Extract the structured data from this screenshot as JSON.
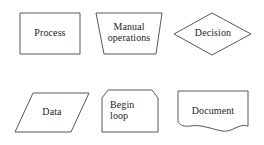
{
  "diagram": {
    "background_color": "#ffffff",
    "stroke_color": "#58585a",
    "text_color": "#1d1d1f",
    "width": 264,
    "height": 145,
    "shapes": [
      {
        "id": "process",
        "label": "Process",
        "symbol_type": "rectangle",
        "points": "20,13 80,13 80,54 20,54"
      },
      {
        "id": "manual-operations",
        "label": "Manual\noperations",
        "symbol_type": "trapezoid",
        "points": "96,13 162,13 156,54 104,54"
      },
      {
        "id": "decision",
        "label": "Decision",
        "symbol_type": "diamond",
        "points": "174,34 212,13 251,34 212,55"
      },
      {
        "id": "data",
        "label": "Data",
        "symbol_type": "parallelogram",
        "points": "33,93 89,93 71,132 15,132"
      },
      {
        "id": "begin-loop",
        "label": "Begin\nloop",
        "symbol_type": "loop-limit",
        "points": "108,90 152,90 158,98 158,132 102,132 102,98"
      },
      {
        "id": "document",
        "label": "Document",
        "symbol_type": "document",
        "path": "M178,91 L248,91 L248,126 C238,123 232,133 222,131 C212,129 200,124 190,126 C184,127 179,125 178,121 Z"
      }
    ]
  }
}
